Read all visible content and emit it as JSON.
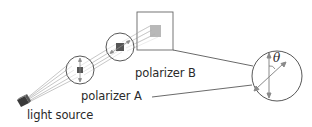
{
  "labels": {
    "polarizer_b": "polarizer B",
    "polarizer_a": "polarizer A",
    "light_source": "light source",
    "angle_symbol": "θ"
  },
  "colors": {
    "line": "#444444",
    "arrow": "#8a8a8a",
    "square_dark": "#555555",
    "square_light": "#b5b5b5",
    "beam": "#9a9a9a"
  }
}
